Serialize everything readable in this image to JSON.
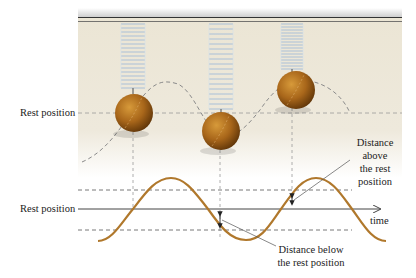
{
  "figure": {
    "colors": {
      "panel_background": "#ece6d6",
      "spring": "#a9bfd8",
      "ball": "#a8661a",
      "wave": "#b0782c",
      "dashed": "#8a8a8a",
      "axis": "#444444",
      "text": "#222222"
    }
  },
  "labels": {
    "rest_position_top": "Rest position",
    "rest_position_bottom": "Rest position",
    "time_axis": "time",
    "distance_above": [
      "Distance",
      "above",
      "the rest",
      "position"
    ],
    "distance_below": [
      "Distance below",
      "the rest position"
    ]
  },
  "springs": [
    {
      "id": "spring-1",
      "position": "at rest"
    },
    {
      "id": "spring-2",
      "position": "below rest"
    },
    {
      "id": "spring-3",
      "position": "above rest"
    }
  ]
}
